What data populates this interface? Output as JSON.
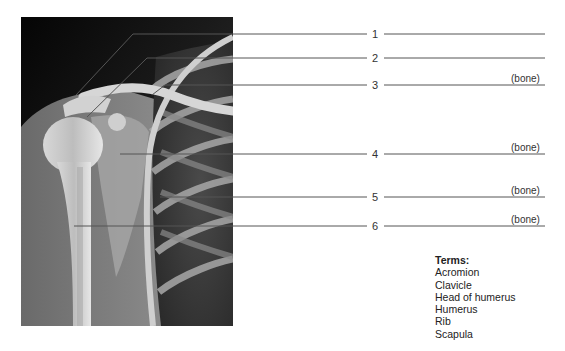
{
  "figure": {
    "image_description": "Anteroposterior radiograph of the right shoulder",
    "labels": [
      {
        "number": "1",
        "hint": ""
      },
      {
        "number": "2",
        "hint": ""
      },
      {
        "number": "3",
        "hint": "(bone)"
      },
      {
        "number": "4",
        "hint": "(bone)"
      },
      {
        "number": "5",
        "hint": "(bone)"
      },
      {
        "number": "6",
        "hint": "(bone)"
      }
    ]
  },
  "terms": {
    "title": "Terms:",
    "items": [
      "Acromion",
      "Clavicle",
      "Head of humerus",
      "Humerus",
      "Rib",
      "Scapula"
    ]
  },
  "colors": {
    "leader_line": "#555555",
    "text": "#222222"
  }
}
